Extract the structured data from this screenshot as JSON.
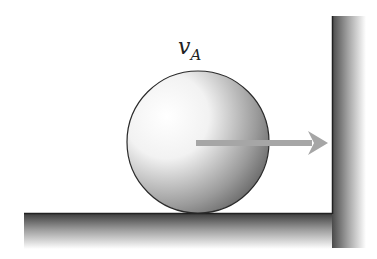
{
  "diagram": {
    "label": {
      "main": "v",
      "subscript": "A"
    },
    "ball": {
      "cx": 198,
      "cy": 142,
      "r": 71
    },
    "arrow": {
      "x1": 196,
      "y1": 143,
      "x2": 328,
      "y2": 143,
      "color": "#a6a6a6"
    },
    "floor": {
      "x": 24,
      "y": 213,
      "width": 310,
      "height": 36
    },
    "wall": {
      "x": 332,
      "y": 16,
      "width": 34,
      "height": 232
    },
    "colors": {
      "outline": "#2a2a2a",
      "shade_dark": "#555555",
      "shade_light": "#ffffff"
    }
  }
}
